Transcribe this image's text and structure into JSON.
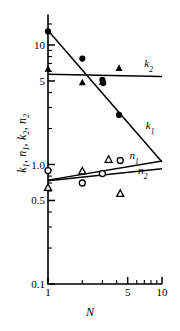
{
  "chart_data": {
    "type": "scatter",
    "title": "",
    "xlabel": "N",
    "ylabel": "k1, n1, k2, n2",
    "ylabel_parts": [
      {
        "sym": "k",
        "sub": "1"
      },
      {
        "sym": "n",
        "sub": "1"
      },
      {
        "sym": "k",
        "sub": "2"
      },
      {
        "sym": "n",
        "sub": "2"
      }
    ],
    "xscale": "log",
    "yscale": "log",
    "xlim": [
      1,
      10
    ],
    "ylim": [
      0.1,
      18
    ],
    "grid": false,
    "legend_position": "inline-curve-labels",
    "xticks": [
      {
        "value": 1,
        "label": "1",
        "major": true
      },
      {
        "value": 2,
        "label": "",
        "major": false
      },
      {
        "value": 3,
        "label": "",
        "major": false
      },
      {
        "value": 4,
        "label": "",
        "major": false
      },
      {
        "value": 5,
        "label": "5",
        "major": true
      },
      {
        "value": 6,
        "label": "",
        "major": false
      },
      {
        "value": 7,
        "label": "",
        "major": false
      },
      {
        "value": 8,
        "label": "",
        "major": false
      },
      {
        "value": 9,
        "label": "",
        "major": false
      },
      {
        "value": 10,
        "label": "10",
        "major": true
      }
    ],
    "yticks": [
      {
        "value": 0.1,
        "label": "0.1",
        "major": true
      },
      {
        "value": 0.2,
        "label": "",
        "major": false
      },
      {
        "value": 0.3,
        "label": "",
        "major": false
      },
      {
        "value": 0.4,
        "label": "",
        "major": false
      },
      {
        "value": 0.5,
        "label": "0.5",
        "major": true
      },
      {
        "value": 0.6,
        "label": "",
        "major": false
      },
      {
        "value": 0.7,
        "label": "",
        "major": false
      },
      {
        "value": 0.8,
        "label": "",
        "major": false
      },
      {
        "value": 0.9,
        "label": "",
        "major": false
      },
      {
        "value": 1.0,
        "label": "1.0",
        "major": true
      },
      {
        "value": 2,
        "label": "",
        "major": false
      },
      {
        "value": 3,
        "label": "",
        "major": false
      },
      {
        "value": 4,
        "label": "",
        "major": false
      },
      {
        "value": 5,
        "label": "5",
        "major": true
      },
      {
        "value": 6,
        "label": "",
        "major": false
      },
      {
        "value": 7,
        "label": "",
        "major": false
      },
      {
        "value": 8,
        "label": "",
        "major": false
      },
      {
        "value": 9,
        "label": "",
        "major": false
      },
      {
        "value": 10,
        "label": "10",
        "major": true
      },
      {
        "value": 15,
        "label": "",
        "major": false
      }
    ],
    "series": [
      {
        "name": "k1",
        "label": "k",
        "label_sub": "1",
        "marker": "filled-circle",
        "color": "#000000",
        "points": [
          {
            "x": 1.0,
            "y": 13.0
          },
          {
            "x": 2.0,
            "y": 7.7
          },
          {
            "x": 3.0,
            "y": 5.1
          },
          {
            "x": 3.05,
            "y": 4.8
          },
          {
            "x": 4.2,
            "y": 2.6
          }
        ],
        "fit_line": {
          "x": [
            1.0,
            10.0
          ],
          "y": [
            13.2,
            1.05
          ]
        },
        "label_pos": {
          "x": 7.2,
          "y": 2.0
        }
      },
      {
        "name": "k2",
        "label": "k",
        "label_sub": "2",
        "marker": "filled-triangle",
        "color": "#000000",
        "points": [
          {
            "x": 1.0,
            "y": 6.3
          },
          {
            "x": 2.0,
            "y": 4.85
          },
          {
            "x": 3.0,
            "y": 4.9
          },
          {
            "x": 4.2,
            "y": 6.4
          }
        ],
        "fit_line": {
          "x": [
            1.0,
            10.0
          ],
          "y": [
            5.7,
            5.45
          ]
        },
        "label_pos": {
          "x": 7.0,
          "y": 6.6
        }
      },
      {
        "name": "n1",
        "label": "n",
        "label_sub": "1",
        "marker": "open-circle",
        "color": "#000000",
        "points": [
          {
            "x": 1.0,
            "y": 0.89
          },
          {
            "x": 2.0,
            "y": 0.7
          },
          {
            "x": 3.0,
            "y": 0.84
          },
          {
            "x": 4.3,
            "y": 1.08
          }
        ],
        "fit_line": {
          "x": [
            1.0,
            10.0
          ],
          "y": [
            0.74,
            1.07
          ]
        },
        "label_pos": {
          "x": 5.2,
          "y": 1.12
        }
      },
      {
        "name": "n2",
        "label": "n",
        "label_sub": "2",
        "marker": "open-triangle",
        "color": "#000000",
        "points": [
          {
            "x": 1.0,
            "y": 0.64
          },
          {
            "x": 2.0,
            "y": 0.88
          },
          {
            "x": 3.4,
            "y": 1.1
          },
          {
            "x": 4.3,
            "y": 0.57
          }
        ],
        "fit_line": {
          "x": [
            1.0,
            10.0
          ],
          "y": [
            0.73,
            0.92
          ]
        },
        "label_pos": {
          "x": 6.2,
          "y": 0.84
        }
      }
    ]
  }
}
